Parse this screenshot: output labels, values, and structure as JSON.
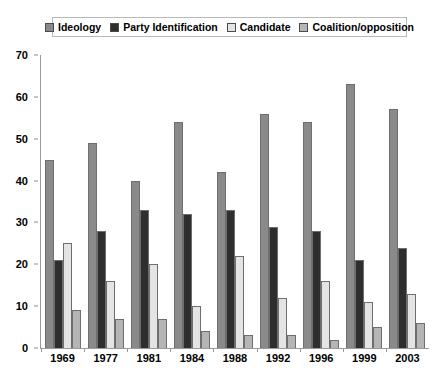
{
  "chart_data": {
    "type": "bar",
    "title": "",
    "xlabel": "",
    "ylabel": "",
    "ylim": [
      0,
      70
    ],
    "yticks": [
      0,
      10,
      20,
      30,
      40,
      50,
      60,
      70
    ],
    "grid": false,
    "legend_position": "top",
    "categories": [
      "1969",
      "1977",
      "1981",
      "1984",
      "1988",
      "1992",
      "1996",
      "1999",
      "2003"
    ],
    "series": [
      {
        "name": "Ideology",
        "color": "#8a8a8a",
        "values": [
          45,
          49,
          40,
          54,
          42,
          56,
          54,
          63,
          57
        ]
      },
      {
        "name": "Party Identification",
        "color": "#2e2e2e",
        "values": [
          21,
          28,
          33,
          32,
          33,
          29,
          28,
          21,
          24
        ]
      },
      {
        "name": "Candidate",
        "color": "#e4e4e4",
        "values": [
          25,
          16,
          20,
          10,
          22,
          12,
          16,
          11,
          13
        ]
      },
      {
        "name": "Coalition/opposition",
        "color": "#b5b5b5",
        "values": [
          9,
          7,
          7,
          4,
          3,
          3,
          2,
          5,
          6
        ]
      }
    ]
  },
  "legend": {
    "items": [
      {
        "label": "Ideology",
        "color": "#8a8a8a"
      },
      {
        "label": "Party Identification",
        "color": "#2e2e2e"
      },
      {
        "label": "Candidate",
        "color": "#e4e4e4"
      },
      {
        "label": "Coalition/opposition",
        "color": "#b5b5b5"
      }
    ]
  },
  "artifact": {
    "top_strip_text": "· · ·        ·              · ·        ·  ·"
  }
}
